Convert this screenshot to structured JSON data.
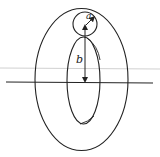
{
  "diagram": {
    "type": "torus-cross-section",
    "labels": {
      "minor_radius": "a",
      "major_radius": "b"
    },
    "colors": {
      "stroke": "#222222",
      "guide_line": "#d0d0d0",
      "background": "#ffffff"
    }
  }
}
